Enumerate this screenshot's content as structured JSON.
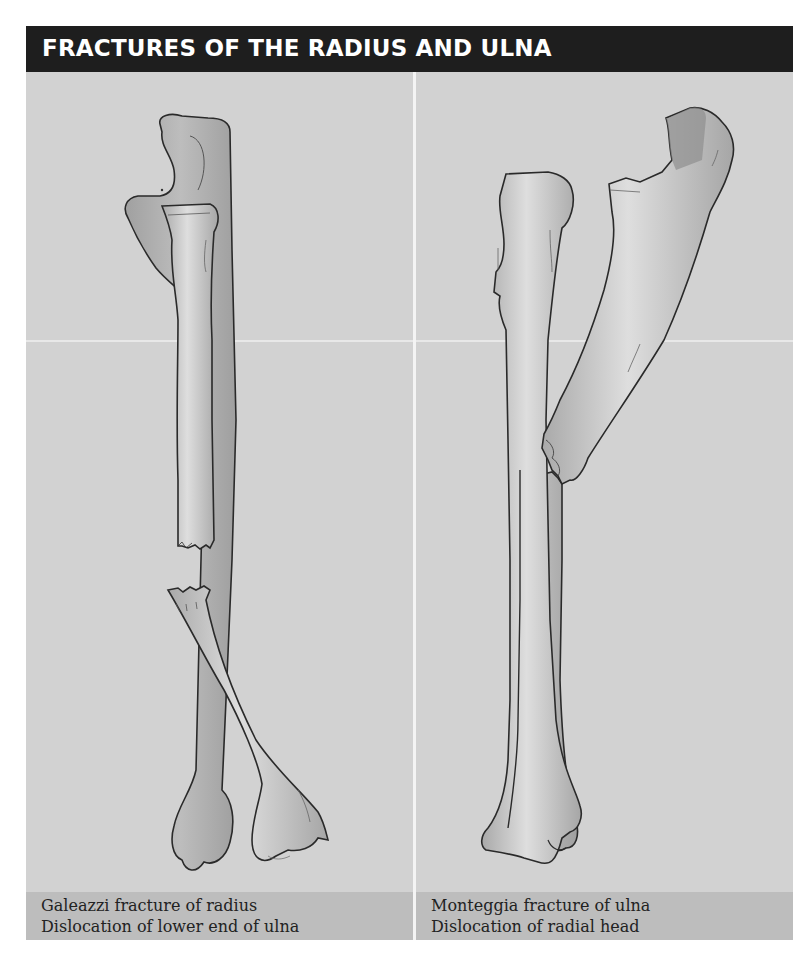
{
  "header": {
    "title": "FRACTURES OF THE RADIUS AND ULNA"
  },
  "panels": [
    {
      "id": "galeazzi",
      "caption_line1": "Galeazzi fracture of radius",
      "caption_line2": "Dislocation of lower end of ulna",
      "bones": [
        "ulna-intact",
        "radius-fractured-upper",
        "radius-fractured-lower"
      ]
    },
    {
      "id": "monteggia",
      "caption_line1": "Monteggia fracture of ulna",
      "caption_line2": "Dislocation of radial head",
      "bones": [
        "radius-dislocated-head",
        "ulna-fractured-upper",
        "ulna-fractured-lower"
      ]
    }
  ],
  "colors": {
    "header_bg": "#1e1e1e",
    "header_text": "#ffffff",
    "panel_bg": "#d2d2d2",
    "caption_bg": "#bdbdbd",
    "bone_fill": "#b3b3b3",
    "bone_highlight": "#dcdcdc",
    "bone_outline": "#2a2a2a",
    "divider": "#f4f4f4"
  }
}
